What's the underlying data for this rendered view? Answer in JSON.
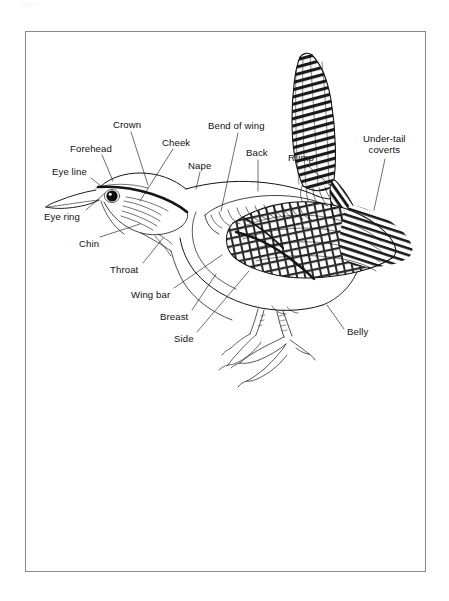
{
  "document": {
    "title": "Bird Anatomy Diagram",
    "subject": "wren",
    "type": "labeled line-drawing illustration",
    "background_color": "#ffffff",
    "ink_color": "#111111",
    "frame_color": "#8a8a8e"
  },
  "frame": {
    "x": 25,
    "y": 31,
    "width": 401,
    "height": 541,
    "border_width": 1.5
  },
  "labels": [
    {
      "id": "crown",
      "text": "Crown",
      "x": 113,
      "y": 119,
      "anchor_x": 148,
      "anchor_y": 185
    },
    {
      "id": "forehead",
      "text": "Forehead",
      "x": 70,
      "y": 143,
      "anchor_x": 113,
      "anchor_y": 180
    },
    {
      "id": "cheek",
      "text": "Cheek",
      "x": 162,
      "y": 137,
      "anchor_x": 138,
      "anchor_y": 200
    },
    {
      "id": "nape",
      "text": "Nape",
      "x": 188,
      "y": 160,
      "anchor_x": 195,
      "anchor_y": 188
    },
    {
      "id": "eye_line",
      "text": "Eye line",
      "x": 52,
      "y": 166,
      "anchor_x": 101,
      "anchor_y": 186
    },
    {
      "id": "eye_ring",
      "text": "Eye ring",
      "x": 44,
      "y": 211,
      "anchor_x": 104,
      "anchor_y": 192
    },
    {
      "id": "chin",
      "text": "Chin",
      "x": 79,
      "y": 238,
      "anchor_x": 138,
      "anchor_y": 226
    },
    {
      "id": "throat",
      "text": "Throat",
      "x": 110,
      "y": 264,
      "anchor_x": 162,
      "anchor_y": 239
    },
    {
      "id": "wing_bar",
      "text": "Wing bar",
      "x": 131,
      "y": 289,
      "anchor_x": 219,
      "anchor_y": 258
    },
    {
      "id": "breast",
      "text": "Breast",
      "x": 160,
      "y": 311,
      "anchor_x": 215,
      "anchor_y": 276
    },
    {
      "id": "side",
      "text": "Side",
      "x": 174,
      "y": 333,
      "anchor_x": 247,
      "anchor_y": 273
    },
    {
      "id": "bend_of_wing",
      "text": "Bend of wing",
      "x": 208,
      "y": 120,
      "anchor_x": 219,
      "anchor_y": 212
    },
    {
      "id": "back",
      "text": "Back",
      "x": 246,
      "y": 147,
      "anchor_x": 257,
      "anchor_y": 192
    },
    {
      "id": "rump",
      "text": "Rump",
      "x": 288,
      "y": 152,
      "anchor_x": 330,
      "anchor_y": 186
    },
    {
      "id": "under_tail_coverts",
      "text": "Under-tail\ncoverts",
      "x": 363,
      "y": 133,
      "anchor_x": 375,
      "anchor_y": 210
    },
    {
      "id": "belly",
      "text": "Belly",
      "x": 347,
      "y": 326,
      "anchor_x": 327,
      "anchor_y": 305
    }
  ],
  "bird_parts": [
    "bill",
    "eye",
    "eye ring",
    "eye line",
    "forehead",
    "crown",
    "cheek",
    "nape",
    "chin",
    "throat",
    "breast",
    "side",
    "belly",
    "wing bar",
    "bend of wing",
    "back",
    "rump",
    "under-tail coverts",
    "tail",
    "legs",
    "feet"
  ]
}
